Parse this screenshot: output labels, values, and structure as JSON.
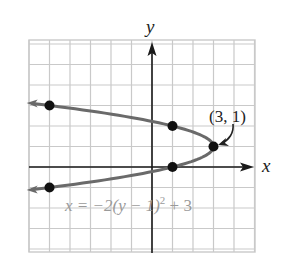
{
  "chart_data": {
    "type": "line",
    "title": "",
    "xlabel": "x",
    "ylabel": "y",
    "xlim": [
      -6,
      5
    ],
    "ylim": [
      -4.2,
      6.2
    ],
    "grid": true,
    "grid_step": 1,
    "series": [
      {
        "name": "x = -2(y - 1)^2 + 3",
        "equation": "x = -2(y - 1)^2 + 3",
        "kind": "parabola opening left",
        "y_range": [
          -1.1,
          3.1
        ],
        "color": "#6a6a6a",
        "arrows_at_ends": true
      }
    ],
    "points": [
      {
        "x": -5,
        "y": 3
      },
      {
        "x": 1,
        "y": 2
      },
      {
        "x": 3,
        "y": 1
      },
      {
        "x": 1,
        "y": 0
      },
      {
        "x": -5,
        "y": -1
      }
    ],
    "annotations": [
      {
        "text": "(3, 1)",
        "points_to": {
          "x": 3,
          "y": 1
        },
        "label": "vertex"
      },
      {
        "text": "x = −2(y − 1)² + 3",
        "label": "equation"
      }
    ]
  },
  "labels": {
    "x_axis": "x",
    "y_axis": "y",
    "vertex": "(3, 1)",
    "equation_prefix": "x = −2(y − 1)",
    "equation_exp": "2",
    "equation_suffix": " + 3"
  },
  "colors": {
    "grid": "#c9c9c9",
    "axes": "#1a1a1a",
    "curve": "#6a6a6a",
    "points": "#111111",
    "equation_text": "#9a9a9a"
  }
}
